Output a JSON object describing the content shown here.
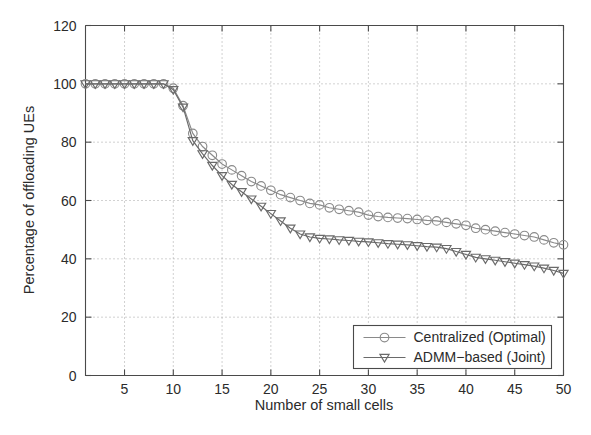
{
  "chart_data": {
    "type": "line",
    "title": "",
    "subtitle": "",
    "xlabel": "Number of small cells",
    "ylabel": "Percentage of offloading UEs",
    "xlim": [
      1,
      50
    ],
    "ylim": [
      0,
      120
    ],
    "xticks": [
      5,
      10,
      15,
      20,
      25,
      30,
      35,
      40,
      45,
      50
    ],
    "yticks": [
      0,
      20,
      40,
      60,
      80,
      100,
      120
    ],
    "xtick_labels": [
      "5",
      "10",
      "15",
      "20",
      "25",
      "30",
      "35",
      "40",
      "45",
      "50"
    ],
    "ytick_labels": [
      "0",
      "20",
      "40",
      "60",
      "80",
      "100",
      "120"
    ],
    "grid": true,
    "grid_style": "dotted",
    "legend_position": "lower right",
    "x": [
      1,
      2,
      3,
      4,
      5,
      6,
      7,
      8,
      9,
      10,
      11,
      12,
      13,
      14,
      15,
      16,
      17,
      18,
      19,
      20,
      21,
      22,
      23,
      24,
      25,
      26,
      27,
      28,
      29,
      30,
      31,
      32,
      33,
      34,
      35,
      36,
      37,
      38,
      39,
      40,
      41,
      42,
      43,
      44,
      45,
      46,
      47,
      48,
      49,
      50
    ],
    "series": [
      {
        "name": "Centralized (Optimal)",
        "marker": "circle",
        "color": "#8a8a8a",
        "values": [
          100,
          100,
          100,
          100,
          100,
          100,
          100,
          100,
          100,
          98.5,
          92.5,
          83,
          78.5,
          75.5,
          72.5,
          70.5,
          68.5,
          66.5,
          65,
          63.5,
          62,
          61,
          60,
          59,
          58.5,
          57.5,
          57,
          56.5,
          56,
          55,
          54.5,
          54.2,
          54,
          53.8,
          53.5,
          53.2,
          53,
          52.5,
          52,
          51.5,
          50.5,
          50,
          49.5,
          49,
          48.5,
          48,
          47.5,
          46.5,
          45.5,
          44.8
        ]
      },
      {
        "name": "ADMM−based (Joint)",
        "marker": "triangle-down",
        "color": "#6a6a6a",
        "values": [
          100,
          100,
          100,
          100,
          100,
          100,
          100,
          100,
          100,
          98,
          92,
          80.5,
          76,
          72,
          68.5,
          65.5,
          63,
          60.5,
          58,
          55.5,
          53,
          50.5,
          48.5,
          47.5,
          47,
          46.8,
          46.5,
          46.3,
          46,
          45.8,
          45.5,
          45.2,
          45,
          44.8,
          44.5,
          44.2,
          44,
          43.5,
          42.5,
          41.5,
          40.5,
          40,
          39.5,
          39,
          38.5,
          38,
          37.5,
          36.8,
          36,
          35
        ]
      }
    ]
  },
  "legend": {
    "entries": [
      {
        "label": "Centralized (Optimal)",
        "marker": "circle-icon"
      },
      {
        "label": "ADMM−based (Joint)",
        "marker": "triangle-down-icon"
      }
    ]
  },
  "colors": {
    "axis": "#4a4a4a",
    "grid": "#9a9a9a",
    "series_1": "#8a8a8a",
    "series_2": "#6a6a6a",
    "background": "#ffffff"
  }
}
